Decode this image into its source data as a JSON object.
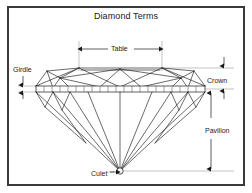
{
  "figure": {
    "title": "Diamond Terms",
    "background_color": "#ffffff",
    "border_color": "#3a3a3a",
    "line_color": "#1a1a1a",
    "guide_color": "#9a9a9a"
  },
  "labels": {
    "table": "Table",
    "girdle": "Girdle",
    "crown": "Crown",
    "pavilion": "Pavilion",
    "culet": "Culet"
  },
  "annotations": [
    {
      "name": "table",
      "label": "Table",
      "arrow": "double-horizontal",
      "position": "above-crown"
    },
    {
      "name": "girdle",
      "label": "Girdle",
      "arrow": "double-vertical-short",
      "position": "left"
    },
    {
      "name": "crown",
      "label": "Crown",
      "arrow": "double-vertical-short",
      "position": "right"
    },
    {
      "name": "pavilion",
      "label": "Pavilion",
      "arrow": "double-vertical-long",
      "position": "right"
    },
    {
      "name": "culet",
      "label": "Culet",
      "arrow": "single-right",
      "position": "bottom"
    }
  ],
  "geometry": {
    "girdle_left_x": 36,
    "girdle_right_x": 205,
    "girdle_top_y": 86,
    "girdle_bottom_y": 92,
    "table_left_x": 79,
    "table_right_x": 162,
    "table_top_y": 68,
    "culet_x": 120,
    "culet_y": 171,
    "girdle_tick_count": 22
  }
}
